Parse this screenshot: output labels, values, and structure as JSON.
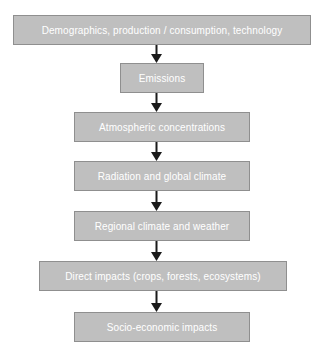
{
  "diagram": {
    "background_color": "#ffffff",
    "box_fill_color": "#bfbfbf",
    "box_border_color": "#8f8f8f",
    "box_text_color": "#ffffff",
    "arrow_color": "#1a1a1a",
    "orientation": "top-to-bottom",
    "nodes": [
      {
        "id": "drivers",
        "label": "Demographics, production / consumption, technology",
        "x": 13,
        "y": 15,
        "width": 298,
        "height": 30
      },
      {
        "id": "emissions",
        "label": "Emissions",
        "x": 120,
        "y": 63,
        "width": 84,
        "height": 30
      },
      {
        "id": "atmospheric-concentrations",
        "label": "Atmospheric concentrations",
        "x": 74,
        "y": 112,
        "width": 176,
        "height": 30
      },
      {
        "id": "radiation-global-climate",
        "label": "Radiation and global climate",
        "x": 74,
        "y": 161,
        "width": 176,
        "height": 30
      },
      {
        "id": "regional-climate-weather",
        "label": "Regional climate and weather",
        "x": 74,
        "y": 211,
        "width": 176,
        "height": 30
      },
      {
        "id": "direct-impacts",
        "label": "Direct impacts (crops, forests, ecosystems)",
        "x": 39,
        "y": 261,
        "width": 248,
        "height": 30
      },
      {
        "id": "socio-economic-impacts",
        "label": "Socio-economic impacts",
        "x": 74,
        "y": 312,
        "width": 176,
        "height": 30
      }
    ],
    "arrows": [
      {
        "id": "arrow-drivers-to-emissions",
        "from": "drivers",
        "to": "emissions",
        "x": 156,
        "y": 45,
        "height": 18
      },
      {
        "id": "arrow-emissions-to-concentrations",
        "from": "emissions",
        "to": "atmospheric-concentrations",
        "x": 156,
        "y": 93,
        "height": 19
      },
      {
        "id": "arrow-concentrations-to-radiation",
        "from": "atmospheric-concentrations",
        "to": "radiation-global-climate",
        "x": 156,
        "y": 142,
        "height": 19
      },
      {
        "id": "arrow-radiation-to-regional",
        "from": "radiation-global-climate",
        "to": "regional-climate-weather",
        "x": 156,
        "y": 191,
        "height": 20
      },
      {
        "id": "arrow-regional-to-direct-impacts",
        "from": "regional-climate-weather",
        "to": "direct-impacts",
        "x": 156,
        "y": 241,
        "height": 20
      },
      {
        "id": "arrow-direct-to-socioeconomic",
        "from": "direct-impacts",
        "to": "socio-economic-impacts",
        "x": 156,
        "y": 291,
        "height": 21
      }
    ]
  }
}
